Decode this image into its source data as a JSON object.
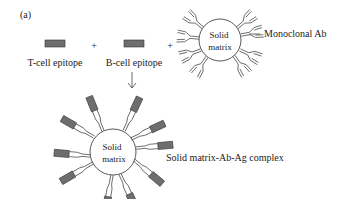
{
  "panel_label": "(a)",
  "components": {
    "t_cell_epitope": {
      "label": "T-cell epitope"
    },
    "b_cell_epitope": {
      "label": "B-cell epitope"
    },
    "plus_1": "+",
    "plus_2": "+",
    "solid_matrix_top": {
      "line1": "Solid",
      "line2": "matrix"
    },
    "monoclonal_ab": {
      "label": "Monoclonal Ab"
    },
    "solid_matrix_bottom": {
      "line1": "Solid",
      "line2": "matrix"
    },
    "complex": {
      "label": "Solid matrix-Ab-Ag complex"
    }
  },
  "colors": {
    "epitope_fill": "#6e6e6e",
    "line": "#444444",
    "text": "#222222"
  }
}
